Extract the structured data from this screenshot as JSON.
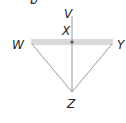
{
  "diagram": {
    "type": "geometry",
    "points": {
      "V": {
        "label": "V",
        "x": 72,
        "y": 16
      },
      "X": {
        "label": "X",
        "x": 72,
        "y": 42
      },
      "W": {
        "label": "W",
        "x": 32,
        "y": 42
      },
      "Y": {
        "label": "Y",
        "x": 112,
        "y": 42
      },
      "Z": {
        "label": "Z",
        "x": 72,
        "y": 92
      }
    },
    "segments": [
      {
        "from": "V",
        "to": "Z",
        "note": "vertical line through X"
      },
      {
        "from": "W",
        "to": "Y",
        "note": "horizontal shaded plane/bar"
      },
      {
        "from": "W",
        "to": "Z"
      },
      {
        "from": "Y",
        "to": "Z"
      }
    ],
    "colors": {
      "line": "#9a9a9a",
      "bar": "#d6d6d6",
      "dot": "#555555",
      "text": "#222222"
    },
    "top_fragment": "b"
  }
}
